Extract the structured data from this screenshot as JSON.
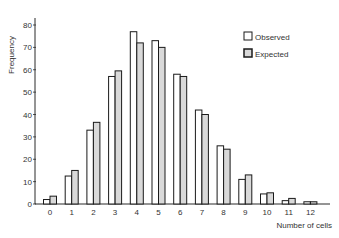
{
  "chart_data": {
    "type": "bar",
    "title": "",
    "xlabel": "Number of cells",
    "ylabel": "Frequency",
    "ylim": [
      0,
      85
    ],
    "yticks": [
      0,
      10,
      20,
      30,
      40,
      50,
      60,
      70,
      80
    ],
    "ytick_labels": [
      "0",
      "10",
      "20",
      "30",
      "40",
      "50",
      "60",
      "70",
      "80"
    ],
    "categories": [
      "0",
      "1",
      "2",
      "3",
      "4",
      "5",
      "6",
      "7",
      "8",
      "9",
      "10",
      "11",
      "12"
    ],
    "series": [
      {
        "name": "Observed",
        "fill": "#ffffff",
        "values": [
          2,
          12.5,
          33,
          57,
          77,
          73,
          58,
          42,
          26,
          11,
          4.5,
          1.5,
          1
        ]
      },
      {
        "name": "Expected",
        "fill": "#d9d9d9",
        "values": [
          3.5,
          15,
          36.5,
          59.5,
          72,
          70,
          57,
          40,
          24.5,
          13,
          5,
          2.5,
          1
        ]
      }
    ],
    "legend": {
      "position": "upper right",
      "entries": [
        "Observed",
        "Expected"
      ]
    },
    "grid": false
  },
  "colors": {
    "axis": "#2a2a2a",
    "observed_fill": "#ffffff",
    "expected_fill": "#d9d9d9",
    "bar_stroke": "#1a1a1a"
  }
}
